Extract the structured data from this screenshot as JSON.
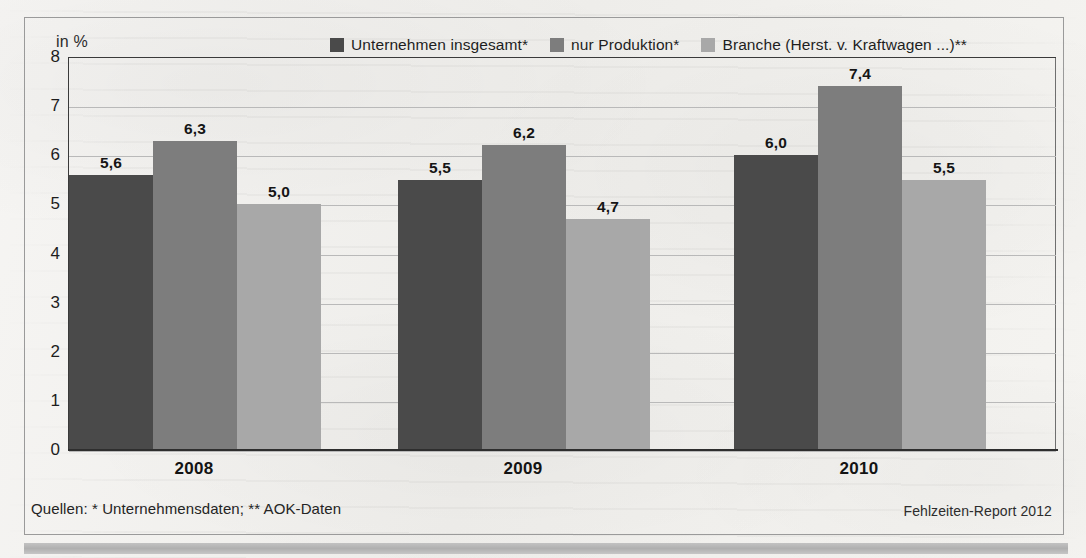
{
  "axis_unit_label": "in %",
  "legend": {
    "items": [
      {
        "label": "Unternehmen insgesamt*",
        "color": "#4a4a4a"
      },
      {
        "label": "nur Produktion*",
        "color": "#7d7d7d"
      },
      {
        "label": "Branche (Herst. v. Kraftwagen ...)**",
        "color": "#a8a8a8"
      }
    ]
  },
  "footer": {
    "source": "Quellen: * Unternehmensdaten; ** AOK-Daten",
    "report": "Fehlzeiten-Report 2012"
  },
  "chart_data": {
    "type": "bar",
    "title": "",
    "subtitle": "",
    "xlabel": "",
    "ylabel": "in %",
    "ylim": [
      0,
      8
    ],
    "yticks": [
      0,
      1,
      2,
      3,
      4,
      5,
      6,
      7,
      8
    ],
    "ytick_labels": [
      "0",
      "1",
      "2",
      "3",
      "4",
      "5",
      "6",
      "7",
      "8"
    ],
    "grid": "horizontal",
    "legend_position": "top-center",
    "categories": [
      "2008",
      "2009",
      "2010"
    ],
    "series": [
      {
        "name": "Unternehmen insgesamt*",
        "color": "#4a4a4a",
        "values": [
          5.6,
          5.5,
          6.0
        ],
        "labels": [
          "5,6",
          "5,5",
          "6,0"
        ]
      },
      {
        "name": "nur Produktion*",
        "color": "#7d7d7d",
        "values": [
          6.3,
          6.2,
          7.4
        ],
        "labels": [
          "6,3",
          "6,2",
          "7,4"
        ]
      },
      {
        "name": "Branche (Herst. v. Kraftwagen ...)**",
        "color": "#a8a8a8",
        "values": [
          5.0,
          4.7,
          5.5
        ],
        "labels": [
          "5,0",
          "4,7",
          "5,5"
        ]
      }
    ]
  }
}
